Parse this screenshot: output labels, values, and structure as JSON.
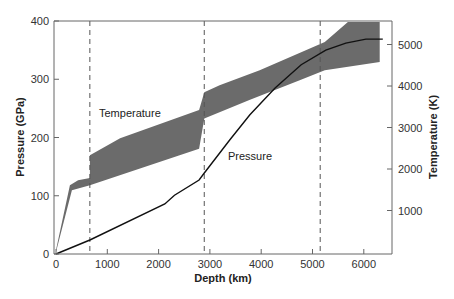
{
  "chart_data": {
    "type": "line",
    "title": "",
    "xlabel": "Depth (km)",
    "ylabel": "Pressure (GPa)",
    "y2label": "Temperature (K)",
    "xlim": [
      0,
      6400
    ],
    "ylim": [
      0,
      400
    ],
    "y2lim": [
      0,
      5600
    ],
    "xticks": [
      0,
      1000,
      2000,
      3000,
      4000,
      5000,
      6000
    ],
    "yticks": [
      0,
      100,
      200,
      300,
      400
    ],
    "y2ticks": [
      1000,
      2000,
      3000,
      4000,
      5000
    ],
    "grid": false,
    "boundaries_km": [
      660,
      2890,
      5150
    ],
    "annotations": [
      {
        "text": "Temperature",
        "x": 900,
        "y": 240,
        "axis": "left"
      },
      {
        "text": "Pressure",
        "x": 3400,
        "y": 135,
        "axis": "left"
      }
    ],
    "series": [
      {
        "name": "Pressure",
        "axis": "left",
        "style": "line",
        "color": "#111111",
        "x": [
          0,
          660,
          2120,
          2310,
          2790,
          2890,
          3390,
          3780,
          4270,
          4780,
          5260,
          5650,
          6040,
          6370
        ],
        "y": [
          0,
          24,
          86,
          101,
          127,
          139,
          196,
          239,
          285,
          325,
          350,
          362,
          369,
          369
        ]
      },
      {
        "name": "Temperature",
        "axis": "right",
        "style": "band",
        "color": "#6b6b6b",
        "x_upper": [
          0,
          270,
          430,
          660,
          660,
          1250,
          2790,
          2890,
          3190,
          3970,
          5240,
          5690,
          6310
        ],
        "upper": [
          50,
          1610,
          1730,
          1780,
          2330,
          2740,
          3420,
          3850,
          4020,
          4380,
          5060,
          5540,
          5540
        ],
        "x_lower": [
          0,
          310,
          660,
          2790,
          2890,
          3770,
          4750,
          5240,
          6310
        ],
        "lower": [
          0,
          1490,
          1610,
          2490,
          3220,
          3660,
          4140,
          4380,
          4580
        ]
      }
    ]
  }
}
